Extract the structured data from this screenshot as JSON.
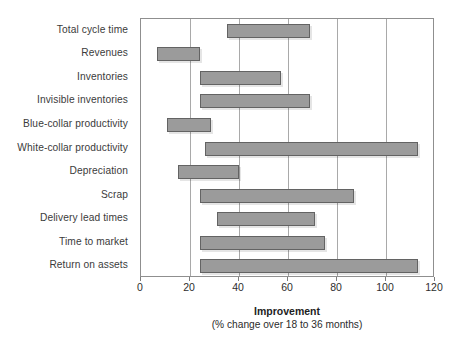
{
  "chart_data": {
    "type": "bar",
    "orientation": "horizontal",
    "variant": "floating-range-bar",
    "title": "",
    "xlabel": "Improvement",
    "xsublabel": "(% change over 18 to 36 months)",
    "ylabel": "",
    "xlim": [
      0,
      120
    ],
    "xticks": [
      0,
      20,
      40,
      60,
      80,
      100,
      120
    ],
    "xtick_labels": [
      "0",
      "20",
      "40",
      "60",
      "80",
      "100",
      "120"
    ],
    "grid": "vertical",
    "legend": "none",
    "bar_fill_color": "#9b9b9b",
    "bar_edge_color": "#636363",
    "categories": [
      "Total cycle time",
      "Revenues",
      "Inventories",
      "Invisible inventories",
      "Blue-collar productivity",
      "White-collar productivity",
      "Depreciation",
      "Scrap",
      "Delivery lead times",
      "Time to market",
      "Return on assets"
    ],
    "ranges": [
      {
        "category": "Total cycle time",
        "low": 35,
        "high": 69
      },
      {
        "category": "Revenues",
        "low": 6.5,
        "high": 24
      },
      {
        "category": "Inventories",
        "low": 24,
        "high": 57
      },
      {
        "category": "Invisible inventories",
        "low": 24,
        "high": 69
      },
      {
        "category": "Blue-collar productivity",
        "low": 10.5,
        "high": 28.5
      },
      {
        "category": "White-collar productivity",
        "low": 26,
        "high": 113
      },
      {
        "category": "Depreciation",
        "low": 15,
        "high": 40
      },
      {
        "category": "Scrap",
        "low": 24,
        "high": 87
      },
      {
        "category": "Delivery lead times",
        "low": 31,
        "high": 71
      },
      {
        "category": "Time to market",
        "low": 24,
        "high": 75
      },
      {
        "category": "Return on assets",
        "low": 24,
        "high": 113
      }
    ]
  }
}
